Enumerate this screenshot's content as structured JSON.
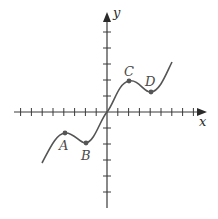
{
  "figure": {
    "x_axis_label": "x",
    "y_axis_label": "y",
    "points": [
      {
        "name": "A",
        "label": "A"
      },
      {
        "name": "B",
        "label": "B"
      },
      {
        "name": "C",
        "label": "C"
      },
      {
        "name": "D",
        "label": "D"
      }
    ],
    "x_ticks_each_side": 8,
    "y_ticks_above": 5,
    "y_ticks_below": 5,
    "colors": {
      "axis": "#3a3a3a",
      "curve": "#555555",
      "background": "#ffffff"
    }
  },
  "chart_data": {
    "type": "line",
    "title": "",
    "xlabel": "x",
    "ylabel": "y",
    "grid": false,
    "xlim": [
      -8,
      9
    ],
    "ylim": [
      -6,
      6
    ],
    "labeled_points": [
      {
        "label": "A",
        "x": -4,
        "y": -1.3
      },
      {
        "label": "B",
        "x": -2,
        "y": -2
      },
      {
        "label": "C",
        "x": 2,
        "y": 2
      },
      {
        "label": "D",
        "x": 4,
        "y": 1.3
      }
    ],
    "curve_endpoints": [
      {
        "x": -6,
        "y": -3.2
      },
      {
        "x": 6,
        "y": 3.2
      }
    ]
  }
}
